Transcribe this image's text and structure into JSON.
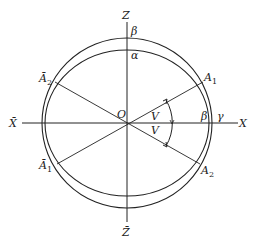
{
  "diagram": {
    "axes": {
      "z_pos": "Z",
      "z_neg": "Z̄",
      "x_pos": "X",
      "x_neg": "X̄",
      "origin": "O"
    },
    "points": {
      "A1": {
        "letter": "A",
        "sub": "1"
      },
      "A2": {
        "letter": "A",
        "sub": "2"
      },
      "A1_bar": {
        "letter": "Ā",
        "sub": "1"
      },
      "A2_bar": {
        "letter": "Ā",
        "sub": "2"
      }
    },
    "greek": {
      "beta_top": "β",
      "alpha_top": "α",
      "beta_right": "β",
      "gamma_right": "γ"
    },
    "angles": {
      "upper": "V",
      "lower": "V"
    },
    "colors": {
      "stroke": "#222222",
      "background": "#ffffff"
    }
  }
}
